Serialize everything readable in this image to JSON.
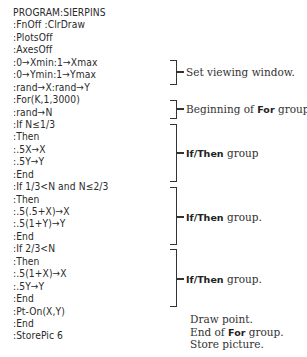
{
  "code_lines": [
    "PROGRAM:SIERPINS",
    ":FnOff :ClrDraw",
    ":PlotsOff",
    ":AxesOff",
    ":0→Xmin:1→Xmax",
    ":0→Ymin:1→Ymax",
    ":rand→X:rand→Y",
    ":For(K,1,3000)",
    ":rand→N",
    ":If N≤1/3",
    ":Then",
    ":.5X→X",
    ":.5Y→Y",
    ":End",
    ":If 1/3<N and N≤2/3",
    ":Then",
    ":.5(.5+X)→X",
    ":.5(1+Y)→Y",
    ":End",
    ":If 2/3<N",
    ":Then",
    ":.5(1+X)→X",
    ":.5Y→Y",
    ":End",
    ":Pt-On(X,Y)",
    ":End",
    ":StorePic 6"
  ],
  "annotations": {
    "viewing": "Set viewing window.",
    "for_begin_pre": "Beginning of ",
    "for_kw": "For",
    "for_begin_post": " group.",
    "ifthen_kw": "If/Then",
    "group1": " group",
    "group2": " group.",
    "group3": " group.",
    "draw": "Draw point.",
    "for_end_pre": "End of ",
    "for_end_post": " group.",
    "store": "Store picture."
  }
}
